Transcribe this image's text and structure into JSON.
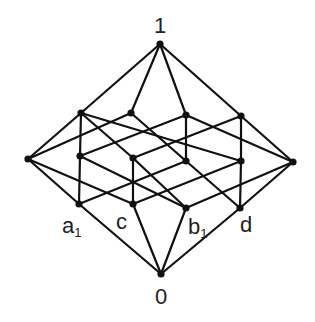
{
  "diagram": {
    "type": "hasse-diagram",
    "colors": {
      "line": "#111111",
      "node": "#111111",
      "text": "#222222",
      "background": "#ffffff"
    },
    "nodes": [
      {
        "id": "top",
        "x": 160,
        "y": 44
      },
      {
        "id": "bottom",
        "x": 161,
        "y": 274
      },
      {
        "id": "left",
        "x": 28,
        "y": 159
      },
      {
        "id": "right",
        "x": 293,
        "y": 162
      },
      {
        "id": "u1",
        "x": 81,
        "y": 113
      },
      {
        "id": "u2",
        "x": 131,
        "y": 113
      },
      {
        "id": "u3",
        "x": 186,
        "y": 115
      },
      {
        "id": "u4",
        "x": 241,
        "y": 116
      },
      {
        "id": "m1",
        "x": 80,
        "y": 156
      },
      {
        "id": "m2",
        "x": 133,
        "y": 158
      },
      {
        "id": "m3",
        "x": 186,
        "y": 161
      },
      {
        "id": "m4",
        "x": 241,
        "y": 161
      },
      {
        "id": "a1",
        "x": 79,
        "y": 204
      },
      {
        "id": "c",
        "x": 133,
        "y": 204
      },
      {
        "id": "b1",
        "x": 186,
        "y": 208
      },
      {
        "id": "d",
        "x": 240,
        "y": 208
      }
    ],
    "edges": [
      [
        "top",
        "u1"
      ],
      [
        "top",
        "u2"
      ],
      [
        "top",
        "u3"
      ],
      [
        "top",
        "u4"
      ],
      [
        "left",
        "u1"
      ],
      [
        "left",
        "u2"
      ],
      [
        "left",
        "a1"
      ],
      [
        "left",
        "c"
      ],
      [
        "right",
        "u3"
      ],
      [
        "right",
        "u4"
      ],
      [
        "right",
        "b1"
      ],
      [
        "right",
        "d"
      ],
      [
        "u1",
        "m1"
      ],
      [
        "u1",
        "m2"
      ],
      [
        "u1",
        "m4"
      ],
      [
        "u2",
        "m3"
      ],
      [
        "u3",
        "m3"
      ],
      [
        "u3",
        "m1"
      ],
      [
        "u4",
        "m4"
      ],
      [
        "u4",
        "m2"
      ],
      [
        "m1",
        "a1"
      ],
      [
        "m1",
        "b1"
      ],
      [
        "m2",
        "c"
      ],
      [
        "m2",
        "b1"
      ],
      [
        "m3",
        "a1"
      ],
      [
        "m3",
        "d"
      ],
      [
        "m4",
        "c"
      ],
      [
        "m4",
        "d"
      ],
      [
        "bottom",
        "a1"
      ],
      [
        "bottom",
        "c"
      ],
      [
        "bottom",
        "b1"
      ],
      [
        "bottom",
        "d"
      ]
    ],
    "labels": {
      "top": "1",
      "bottom": "0",
      "a1_main": "a",
      "a1_sub": "1",
      "c": "c",
      "b1_main": "b",
      "b1_sub": "1",
      "d": "d"
    }
  }
}
